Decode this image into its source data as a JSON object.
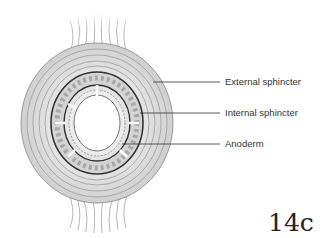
{
  "diagram": {
    "labels": [
      {
        "id": "external",
        "text": "External sphincter"
      },
      {
        "id": "internal",
        "text": "Internal sphincter"
      },
      {
        "id": "anoderm",
        "text": "Anoderm"
      }
    ],
    "figure_number": "14c",
    "colors": {
      "muscle_fibers": "#9a9a9a",
      "ring_outline": "#3a3a3a",
      "leader_lines": "#333333",
      "background": "#ffffff"
    }
  }
}
